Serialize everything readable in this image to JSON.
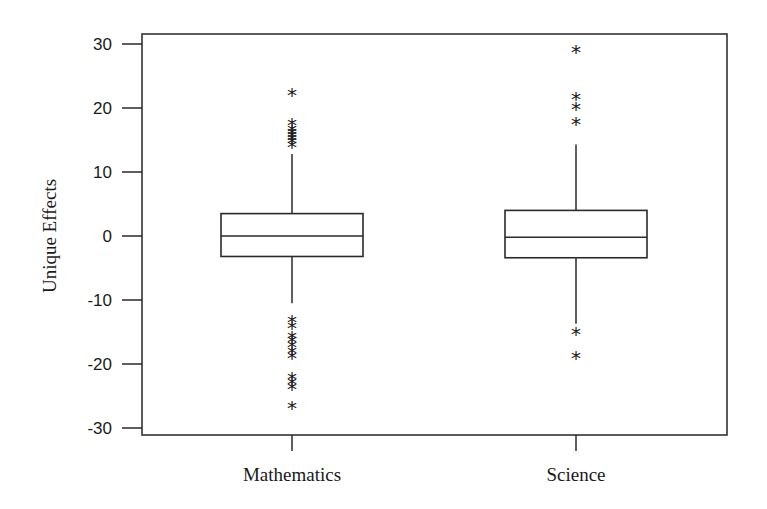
{
  "chart_data": {
    "type": "box",
    "title": "",
    "xlabel": "",
    "ylabel": "Unique Effects",
    "ylim": [
      -31.5,
      31.5
    ],
    "yticks": [
      30,
      20,
      10,
      0,
      -10,
      -20,
      -30
    ],
    "ytick_labels": [
      "30",
      "20",
      "10",
      "0",
      "-10",
      "-20",
      "-30"
    ],
    "grid": false,
    "legend": null,
    "categories": [
      "Mathematics",
      "Science"
    ],
    "series": [
      {
        "name": "Mathematics",
        "whisker_low": -10.5,
        "q1": -3.2,
        "median": 0.0,
        "q3": 3.5,
        "whisker_high": 12.8,
        "outliers": [
          22.3,
          17.7,
          16.7,
          16.3,
          15.8,
          15.3,
          14.8,
          14.2,
          -13.2,
          -14.0,
          -15.7,
          -16.3,
          -17.1,
          -17.9,
          -18.7,
          -22.0,
          -22.8,
          -23.6,
          -26.6
        ]
      },
      {
        "name": "Science",
        "whisker_low": -13.7,
        "q1": -3.4,
        "median": -0.2,
        "q3": 4.0,
        "whisker_high": 14.3,
        "outliers": [
          29.0,
          21.7,
          20.2,
          17.8,
          -15.0,
          -18.7
        ]
      }
    ],
    "marker_symbol": "*",
    "colors": {
      "line": "#2a2a2a",
      "background": "#ffffff"
    }
  }
}
